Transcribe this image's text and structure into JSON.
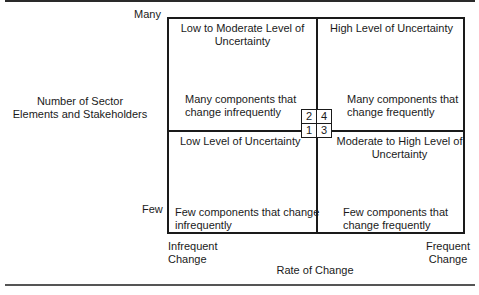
{
  "y_axis": {
    "title_line1": "Number of Sector",
    "title_line2": "Elements and Stakeholders",
    "high_label": "Many",
    "low_label": "Few"
  },
  "x_axis": {
    "title": "Rate of Change",
    "low_label_line1": "Infrequent",
    "low_label_line2": "Change",
    "high_label_line1": "Frequent",
    "high_label_line2": "Change"
  },
  "quadrants": [
    {
      "number": "2",
      "heading_line1": "Low to Moderate Level of",
      "heading_line2": "Uncertainty",
      "desc_line1": "Many components that",
      "desc_line2": "change infrequently"
    },
    {
      "number": "4",
      "heading_line1": "High Level of Uncertainty",
      "heading_line2": "",
      "desc_line1": "Many components that",
      "desc_line2": "change frequently"
    },
    {
      "number": "1",
      "heading_line1": "Low Level of Uncertainty",
      "heading_line2": "",
      "desc_line1": "Few components that change",
      "desc_line2": "infrequently"
    },
    {
      "number": "3",
      "heading_line1": "Moderate to High Level of",
      "heading_line2": "Uncertainty",
      "desc_line1": "Few components that",
      "desc_line2": "change frequently"
    }
  ]
}
